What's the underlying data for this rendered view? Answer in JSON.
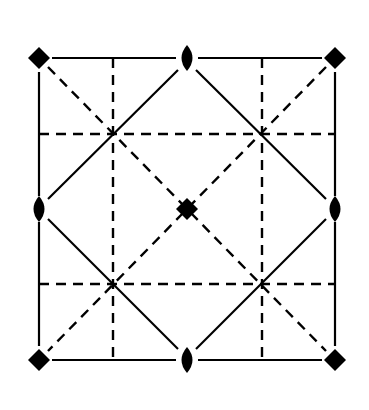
{
  "diagram": {
    "title": "",
    "colors": {
      "ink": "#000000",
      "background": "#ffffff"
    },
    "frame": {
      "x0": 39,
      "y0": 58,
      "x1": 335,
      "y1": 360
    },
    "four_fold_axes": [
      {
        "x": 39,
        "y": 58
      },
      {
        "x": 335,
        "y": 58
      },
      {
        "x": 187,
        "y": 209
      },
      {
        "x": 39,
        "y": 360
      },
      {
        "x": 335,
        "y": 360
      }
    ],
    "two_fold_axes": [
      {
        "x": 187,
        "y": 58
      },
      {
        "x": 39,
        "y": 209
      },
      {
        "x": 335,
        "y": 209
      },
      {
        "x": 187,
        "y": 360
      }
    ],
    "solid_lines": [
      {
        "x1": 52,
        "y1": 58,
        "x2": 176,
        "y2": 58
      },
      {
        "x1": 198,
        "y1": 58,
        "x2": 322,
        "y2": 58
      },
      {
        "x1": 52,
        "y1": 360,
        "x2": 176,
        "y2": 360
      },
      {
        "x1": 198,
        "y1": 360,
        "x2": 322,
        "y2": 360
      },
      {
        "x1": 39,
        "y1": 72,
        "x2": 39,
        "y2": 196
      },
      {
        "x1": 39,
        "y1": 222,
        "x2": 39,
        "y2": 346
      },
      {
        "x1": 335,
        "y1": 72,
        "x2": 335,
        "y2": 196
      },
      {
        "x1": 335,
        "y1": 222,
        "x2": 335,
        "y2": 346
      },
      {
        "x1": 178,
        "y1": 70,
        "x2": 48,
        "y2": 199
      },
      {
        "x1": 196,
        "y1": 70,
        "x2": 326,
        "y2": 199
      },
      {
        "x1": 48,
        "y1": 219,
        "x2": 178,
        "y2": 349
      },
      {
        "x1": 326,
        "y1": 219,
        "x2": 196,
        "y2": 349
      }
    ],
    "dashed_lines": [
      {
        "x1": 113,
        "y1": 58,
        "x2": 113,
        "y2": 360
      },
      {
        "x1": 262,
        "y1": 58,
        "x2": 262,
        "y2": 360
      },
      {
        "x1": 39,
        "y1": 134,
        "x2": 335,
        "y2": 134
      },
      {
        "x1": 39,
        "y1": 284,
        "x2": 335,
        "y2": 284
      },
      {
        "x1": 48,
        "y1": 67,
        "x2": 326,
        "y2": 351
      },
      {
        "x1": 326,
        "y1": 67,
        "x2": 48,
        "y2": 351
      }
    ]
  }
}
